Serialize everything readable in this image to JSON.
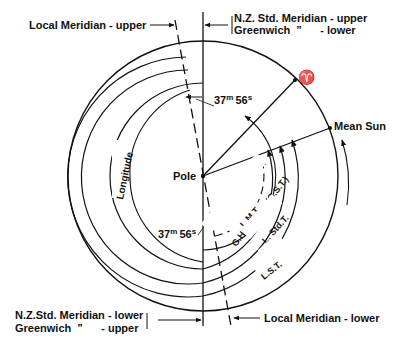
{
  "diagram": {
    "labels": {
      "local_meridian_upper": "Local Meridian - upper",
      "nz_std_meridian_upper": "N.Z. Std. Meridian - upper",
      "greenwich_lower": "Greenwich  ”      - lower",
      "nz_std_meridian_lower": "N.Z.Std. Meridian - lower",
      "greenwich_upper": "Greenwich  ”      - upper",
      "local_meridian_lower": "Local Meridian - lower",
      "aries_symbol": "♈",
      "mean_sun": "Mean Sun",
      "pole": "Pole",
      "longitude": "Longitude",
      "lmt": "L.M.T.",
      "gha_aries": "G.H.A. Aries (G.S.T.)",
      "l_std_t": "L. Std.T.",
      "ut": "U.T.",
      "lst": "L.S.T."
    },
    "interval": {
      "minutes": "37",
      "minutes_unit": "m",
      "seconds": "56",
      "seconds_unit": "s"
    },
    "colors": {
      "ink": "#111111",
      "background": "#ffffff"
    }
  }
}
